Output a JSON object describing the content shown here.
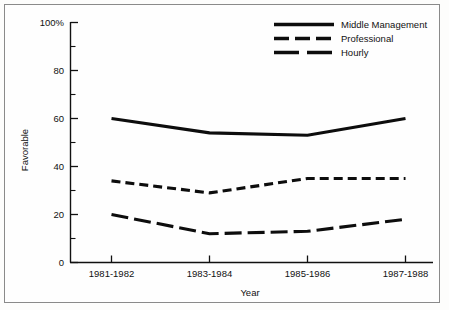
{
  "chart_data": {
    "type": "line",
    "title": "",
    "xlabel": "Year",
    "ylabel": "Favorable",
    "categories": [
      "1981-1982",
      "1983-1984",
      "1985-1986",
      "1987-1988"
    ],
    "series": [
      {
        "name": "Middle Management",
        "style": "solid",
        "values": [
          60,
          54,
          53,
          60
        ]
      },
      {
        "name": "Professional",
        "style": "dashed-short",
        "values": [
          34,
          29,
          35,
          35
        ]
      },
      {
        "name": "Hourly",
        "style": "dashed-long",
        "values": [
          20,
          12,
          13,
          18
        ]
      }
    ],
    "ylim": [
      0,
      100
    ],
    "y_ticks": [
      0,
      20,
      40,
      60,
      80,
      100
    ],
    "y_tick_labels": [
      "0",
      "20",
      "40",
      "60",
      "80",
      "100%"
    ],
    "y_minor_ticks": [
      10,
      30,
      50,
      70,
      90
    ],
    "grid": false,
    "legend_position": "top-right"
  },
  "axes": {
    "y_title": "Favorable",
    "x_title": "Year"
  },
  "legend": {
    "entries": [
      {
        "label": "Middle Management"
      },
      {
        "label": "Professional"
      },
      {
        "label": "Hourly"
      }
    ]
  }
}
